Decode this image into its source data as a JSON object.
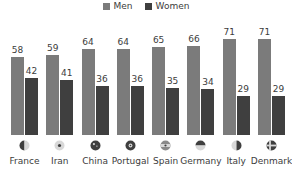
{
  "chart_data": {
    "type": "bar",
    "title": "",
    "subtitle": "",
    "xlabel": "",
    "ylabel": "",
    "ylim": [
      0,
      80
    ],
    "grid": false,
    "legend_position": "top-center",
    "categories": [
      "France",
      "Iran",
      "China",
      "Portugal",
      "Spain",
      "Germany",
      "Italy",
      "Denmark"
    ],
    "series": [
      {
        "name": "Men",
        "color": "#7b7b7b",
        "values": [
          58,
          59,
          64,
          64,
          65,
          66,
          71,
          71
        ]
      },
      {
        "name": "Women",
        "color": "#3f3f3f",
        "values": [
          42,
          41,
          36,
          36,
          35,
          34,
          29,
          29
        ]
      }
    ]
  },
  "legend": {
    "items": [
      {
        "label": "Men",
        "color": "#7b7b7b",
        "icon": "square-swatch-icon"
      },
      {
        "label": "Women",
        "color": "#3f3f3f",
        "icon": "square-swatch-icon"
      }
    ]
  },
  "axis": {
    "items": [
      {
        "label": "France",
        "icon": "flag-icon-france",
        "men": 58,
        "women": 42
      },
      {
        "label": "Iran",
        "icon": "flag-icon-iran",
        "men": 59,
        "women": 41
      },
      {
        "label": "China",
        "icon": "flag-icon-china",
        "men": 64,
        "women": 36
      },
      {
        "label": "Portugal",
        "icon": "flag-icon-portugal",
        "men": 64,
        "women": 36
      },
      {
        "label": "Spain",
        "icon": "flag-icon-spain",
        "men": 65,
        "women": 35
      },
      {
        "label": "Germany",
        "icon": "flag-icon-germany",
        "men": 66,
        "women": 34
      },
      {
        "label": "Italy",
        "icon": "flag-icon-italy",
        "men": 71,
        "women": 29
      },
      {
        "label": "Denmark",
        "icon": "flag-icon-denmark",
        "men": 71,
        "women": 29
      }
    ]
  }
}
